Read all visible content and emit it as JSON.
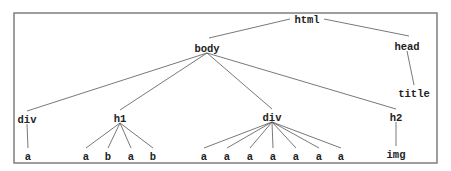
{
  "diagram": {
    "type": "tree",
    "colors": {
      "line": "#555555",
      "text": "#222222",
      "frame": "#6b6b6b",
      "background": "#ffffff"
    },
    "nodes": [
      {
        "id": "html",
        "label": "html",
        "x": 307,
        "y": 20
      },
      {
        "id": "body",
        "label": "body",
        "x": 207,
        "y": 49
      },
      {
        "id": "head",
        "label": "head",
        "x": 407,
        "y": 47
      },
      {
        "id": "title",
        "label": "title",
        "x": 414,
        "y": 94
      },
      {
        "id": "div1",
        "label": "div",
        "x": 27,
        "y": 120
      },
      {
        "id": "div1_a",
        "label": "a",
        "x": 28,
        "y": 157
      },
      {
        "id": "h1",
        "label": "h1",
        "x": 120,
        "y": 119
      },
      {
        "id": "h1_a1",
        "label": "a",
        "x": 86,
        "y": 157
      },
      {
        "id": "h1_b1",
        "label": "b",
        "x": 108,
        "y": 157
      },
      {
        "id": "h1_a2",
        "label": "a",
        "x": 131,
        "y": 157
      },
      {
        "id": "h1_b2",
        "label": "b",
        "x": 153,
        "y": 157
      },
      {
        "id": "div2",
        "label": "div",
        "x": 272,
        "y": 118
      },
      {
        "id": "div2_a1",
        "label": "a",
        "x": 204,
        "y": 157
      },
      {
        "id": "div2_a2",
        "label": "a",
        "x": 227,
        "y": 157
      },
      {
        "id": "div2_a3",
        "label": "a",
        "x": 250,
        "y": 157
      },
      {
        "id": "div2_a4",
        "label": "a",
        "x": 273,
        "y": 157
      },
      {
        "id": "div2_a5",
        "label": "a",
        "x": 296,
        "y": 157
      },
      {
        "id": "div2_a6",
        "label": "a",
        "x": 319,
        "y": 157
      },
      {
        "id": "div2_a7",
        "label": "a",
        "x": 341,
        "y": 157
      },
      {
        "id": "h2",
        "label": "h2",
        "x": 396,
        "y": 118
      },
      {
        "id": "img",
        "label": "img",
        "x": 396,
        "y": 155
      }
    ],
    "edges": [
      [
        "html",
        "body"
      ],
      [
        "html",
        "head"
      ],
      [
        "head",
        "title"
      ],
      [
        "body",
        "div1"
      ],
      [
        "body",
        "h1"
      ],
      [
        "body",
        "div2"
      ],
      [
        "body",
        "h2"
      ],
      [
        "div1",
        "div1_a"
      ],
      [
        "h1",
        "h1_a1"
      ],
      [
        "h1",
        "h1_b1"
      ],
      [
        "h1",
        "h1_a2"
      ],
      [
        "h1",
        "h1_b2"
      ],
      [
        "div2",
        "div2_a1"
      ],
      [
        "div2",
        "div2_a2"
      ],
      [
        "div2",
        "div2_a3"
      ],
      [
        "div2",
        "div2_a4"
      ],
      [
        "div2",
        "div2_a5"
      ],
      [
        "div2",
        "div2_a6"
      ],
      [
        "div2",
        "div2_a7"
      ],
      [
        "h2",
        "img"
      ]
    ]
  }
}
